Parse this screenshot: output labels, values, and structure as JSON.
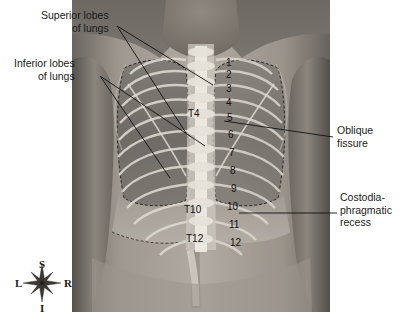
{
  "figure": {
    "photo": {
      "x": 72,
      "y": 0,
      "width": 258,
      "height": 312
    }
  },
  "labels": [
    {
      "name": "superior-lobes-of-lungs",
      "line1": "Superior lobes",
      "line2": "of lungs",
      "align": "right",
      "x": 41,
      "y": 9,
      "leaders": [
        {
          "x1": 117,
          "y1": 26,
          "x2": 186,
          "y2": 133
        },
        {
          "x1": 117,
          "y1": 26,
          "x2": 213,
          "y2": 85
        }
      ]
    },
    {
      "name": "inferior-lobes-of-lungs",
      "line1": "Inferior lobes",
      "line2": "of lungs",
      "align": "right",
      "x": 14,
      "y": 57,
      "leaders": [
        {
          "x1": 100,
          "y1": 76,
          "x2": 170,
          "y2": 178
        },
        {
          "x1": 100,
          "y1": 76,
          "x2": 205,
          "y2": 146
        }
      ]
    },
    {
      "name": "oblique-fissure",
      "line1": "Oblique",
      "line2": "fissure",
      "align": "left",
      "x": 337,
      "y": 124,
      "leaders": [
        {
          "x1": 333,
          "y1": 137,
          "x2": 224,
          "y2": 121
        }
      ]
    },
    {
      "name": "costodiaphragmatic-recess",
      "line1": "Costodia-",
      "line2": "phragmatic",
      "line3": "recess",
      "align": "left",
      "x": 340,
      "y": 191,
      "leaders": [
        {
          "x1": 337,
          "y1": 213,
          "x2": 239,
          "y2": 213
        }
      ]
    }
  ],
  "rib_numbers": [
    {
      "label": "1",
      "x": 226,
      "y": 58
    },
    {
      "label": "2",
      "x": 226,
      "y": 70
    },
    {
      "label": "3",
      "x": 226,
      "y": 84
    },
    {
      "label": "4",
      "x": 226,
      "y": 98
    },
    {
      "label": "5",
      "x": 227,
      "y": 113
    },
    {
      "label": "6",
      "x": 228,
      "y": 130
    },
    {
      "label": "7",
      "x": 229,
      "y": 148
    },
    {
      "label": "8",
      "x": 230,
      "y": 166
    },
    {
      "label": "9",
      "x": 231,
      "y": 184
    },
    {
      "label": "10",
      "x": 227,
      "y": 202
    },
    {
      "label": "11",
      "x": 229,
      "y": 220
    },
    {
      "label": "12",
      "x": 230,
      "y": 238
    }
  ],
  "vertebrae": [
    {
      "label": "T4",
      "x": 188,
      "y": 109
    },
    {
      "label": "T10",
      "x": 184,
      "y": 205
    },
    {
      "label": "T12",
      "x": 186,
      "y": 234
    }
  ],
  "compass": {
    "center_x": 42,
    "center_y": 283,
    "superior": "S",
    "inferior": "I",
    "left": "L",
    "right": "R"
  },
  "colors": {
    "background": "#ffffff",
    "label_text": "#1a1a1a",
    "leader_line": "#111111",
    "skin_light": "#b9b3ad",
    "skin_mid": "#8e8882",
    "skin_dark": "#5f5a56",
    "lung_field": "#6e6a66",
    "bone_bright": "#e8e4dc",
    "recess": "#a9a39c"
  }
}
